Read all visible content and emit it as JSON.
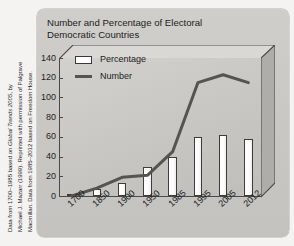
{
  "credit": {
    "lines": [
      "Data from 1700–1985 based on Global Trends 2005, by",
      "Michael J. Mazarr (1999). Reprinted with permission of Palgrave",
      "Macmillan. Data from 1985–2012 based on Freedom House."
    ],
    "italic_phrase": "Global Trends 2005"
  },
  "title": {
    "line1": "Number and Percentage of Electoral",
    "line2": "Democratic Countries"
  },
  "colors": {
    "card_bg": "#c9c8c5",
    "plot_bg": "#c7c6c3",
    "axis": "#4a4a4a",
    "bar_fill": "#ffffff",
    "bar_stroke": "#3d3d3d",
    "line": "#555452",
    "text": "#1d1d1d"
  },
  "chart_data": {
    "type": "bar",
    "title": "Number and Percentage of Electoral Democratic Countries",
    "xlabel": "",
    "ylabel": "",
    "categories": [
      "1700",
      "1850",
      "1900",
      "1950",
      "1985",
      "1995",
      "2005",
      "2012"
    ],
    "yticks": [
      0,
      20,
      40,
      60,
      80,
      100,
      120,
      140
    ],
    "ylim": [
      0,
      140
    ],
    "grid": false,
    "legend_position": "top-left",
    "series": [
      {
        "name": "Percentage",
        "type": "bar",
        "values": [
          2,
          7,
          13,
          29,
          40,
          60,
          62,
          58
        ]
      },
      {
        "name": "Number",
        "type": "line",
        "values": [
          0,
          8,
          19,
          21,
          45,
          115,
          123,
          115
        ]
      }
    ]
  },
  "legend": {
    "items": [
      {
        "label": "Percentage",
        "marker": "box"
      },
      {
        "label": "Number",
        "marker": "line"
      }
    ]
  }
}
